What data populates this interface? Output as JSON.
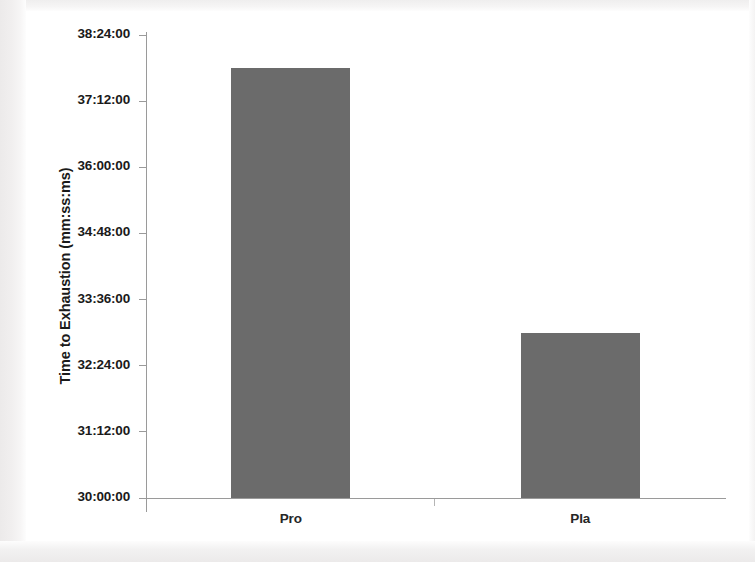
{
  "chart_data": {
    "type": "bar",
    "title": "",
    "xlabel": "",
    "ylabel": "Time to Exhaustion (mm:ss:ms)",
    "categories": [
      "Pro",
      "Pla"
    ],
    "values": [
      "37:48:00",
      "33:00:00"
    ],
    "value_seconds": [
      2268,
      1980
    ],
    "ylim": [
      "30:00:00",
      "38:24:00"
    ],
    "ytick_labels": [
      "30:00:00",
      "31:12:00",
      "32:24:00",
      "33:36:00",
      "34:48:00",
      "36:00:00",
      "37:12:00",
      "38:24:00"
    ],
    "ytick_seconds": [
      1800,
      1872,
      1944,
      2016,
      2088,
      2160,
      2232,
      2304
    ],
    "grid": false,
    "legend": false,
    "bar_color": "#6b6b6b",
    "axis_color": "#9a9a9a",
    "text_color": "#1a1a1a",
    "background_color": "#ffffff"
  }
}
